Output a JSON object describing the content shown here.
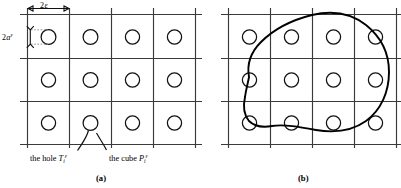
{
  "figure": {
    "panels": [
      {
        "id": "a",
        "caption": "(a)",
        "caption_x": 103,
        "caption_y": 180,
        "description": "Uniform square grid of cubes each containing a circular hole"
      },
      {
        "id": "b",
        "caption": "(b)",
        "caption_y": 180,
        "caption_x": 305,
        "description": "Same grid overlaid by a smooth closed curve (domain boundary)"
      }
    ],
    "dimensions": {
      "cell_width_label": "2",
      "cell_width_symbol": "ε",
      "hole_diameter_label": "2",
      "hole_diameter_symbol": "a",
      "hole_diameter_superscript": "ε"
    },
    "annotations": [
      {
        "name": "hole-label",
        "text": "the hole ",
        "symbol": "T",
        "subscript": "i",
        "superscript": "ε",
        "x": 30,
        "y": 160
      },
      {
        "name": "cube-label",
        "text": "the cube ",
        "symbol": "P",
        "subscript": "i",
        "superscript": "ε",
        "x": 108,
        "y": 160
      }
    ],
    "colors": {
      "grid": "#3a3a3a",
      "hole_stroke": "#111111",
      "blob_stroke": "#000000",
      "dimension_dotted": "#8a8a8a",
      "background": "#ffffff",
      "text": "#000000"
    },
    "counts": {
      "columns": 4,
      "rows": 3,
      "holes_per_panel": 12
    }
  }
}
